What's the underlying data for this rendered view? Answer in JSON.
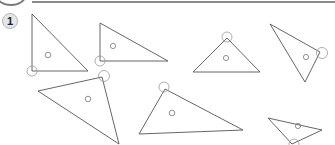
{
  "worksheet": {
    "exercise_number": "1",
    "exercise_badge_color": "#e6e6e6",
    "line_color": "#555555",
    "marker_color": "#999999",
    "triangles": [
      {
        "name": "triangle-1",
        "marked_vertex": "bottom-left"
      },
      {
        "name": "triangle-2",
        "marked_vertex": "bottom-left"
      },
      {
        "name": "triangle-3",
        "marked_vertex": "top"
      },
      {
        "name": "triangle-4",
        "marked_vertex": "right"
      },
      {
        "name": "triangle-5",
        "marked_vertex": "top-right"
      },
      {
        "name": "triangle-6",
        "marked_vertex": "top"
      },
      {
        "name": "triangle-7",
        "marked_vertex": "bottom"
      }
    ]
  }
}
